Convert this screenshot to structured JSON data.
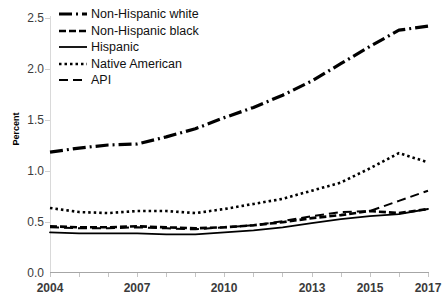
{
  "chart_data": {
    "type": "line",
    "title": "",
    "xlabel": "",
    "ylabel": "Percent",
    "xlim": [
      2004,
      2017
    ],
    "ylim": [
      0.0,
      2.5
    ],
    "grid": false,
    "legend_position": "top-left",
    "x": [
      2004,
      2005,
      2006,
      2007,
      2008,
      2009,
      2010,
      2011,
      2012,
      2013,
      2014,
      2015,
      2016,
      2017
    ],
    "xtick_labels": [
      "2004",
      "2007",
      "2010",
      "2013",
      "2015",
      "2017"
    ],
    "xtick_values": [
      2004,
      2007,
      2010,
      2013,
      2015,
      2017
    ],
    "ytick_labels": [
      "0.0",
      "0.5",
      "1.0",
      "1.5",
      "2.0",
      "2.5"
    ],
    "ytick_values": [
      0.0,
      0.5,
      1.0,
      1.5,
      2.0,
      2.5
    ],
    "series": [
      {
        "name": "Non-Hispanic white",
        "style": "dash-dot",
        "values": [
          1.18,
          1.22,
          1.25,
          1.26,
          1.33,
          1.41,
          1.52,
          1.62,
          1.74,
          1.88,
          2.05,
          2.22,
          2.38,
          2.42
        ]
      },
      {
        "name": "Non-Hispanic black",
        "style": "dashed",
        "values": [
          0.45,
          0.44,
          0.44,
          0.45,
          0.44,
          0.43,
          0.44,
          0.46,
          0.49,
          0.53,
          0.56,
          0.6,
          0.58,
          0.62
        ]
      },
      {
        "name": "Hispanic",
        "style": "solid",
        "values": [
          0.39,
          0.38,
          0.38,
          0.38,
          0.37,
          0.37,
          0.39,
          0.41,
          0.44,
          0.48,
          0.52,
          0.55,
          0.57,
          0.62
        ]
      },
      {
        "name": "Native American",
        "style": "dotted",
        "values": [
          0.63,
          0.59,
          0.58,
          0.6,
          0.6,
          0.58,
          0.62,
          0.67,
          0.72,
          0.8,
          0.88,
          1.02,
          1.17,
          1.08
        ]
      },
      {
        "name": "API",
        "style": "long-dash",
        "values": [
          0.44,
          0.43,
          0.43,
          0.44,
          0.43,
          0.42,
          0.44,
          0.46,
          0.5,
          0.55,
          0.59,
          0.6,
          0.7,
          0.8
        ]
      }
    ]
  },
  "legend": {
    "items": [
      {
        "label": "Non-Hispanic white"
      },
      {
        "label": "Non-Hispanic black"
      },
      {
        "label": "Hispanic"
      },
      {
        "label": "Native American"
      },
      {
        "label": "API"
      }
    ]
  },
  "colors": {
    "series": "#000000",
    "axis": "#a6a6a6",
    "tick_text": "#3b3b3b",
    "background": "#ffffff"
  }
}
